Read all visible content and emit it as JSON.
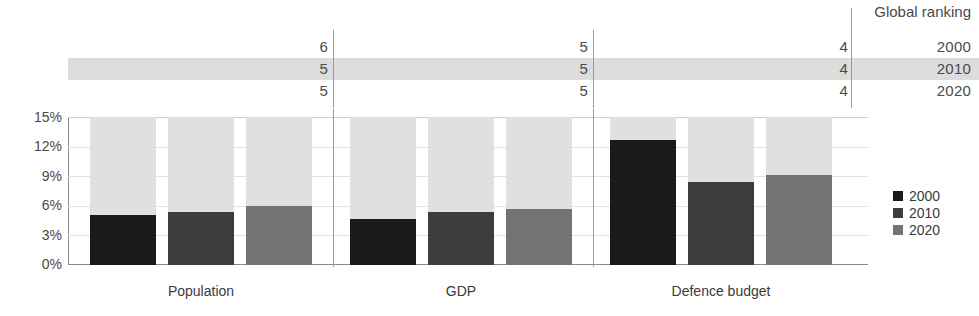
{
  "chart_data": {
    "type": "bar",
    "title": "",
    "subtitle": "",
    "xlabel": "",
    "ylabel": "",
    "ylim": [
      0,
      15
    ],
    "y_unit": "%",
    "grid": true,
    "legend_position": "right",
    "categories": [
      "Population",
      "GDP",
      "Defence budget"
    ],
    "series": [
      {
        "name": "2000",
        "color": "#1a1a1a",
        "values": [
          5.1,
          4.7,
          12.7
        ]
      },
      {
        "name": "2010",
        "color": "#3d3d3d",
        "values": [
          5.4,
          5.4,
          8.4
        ]
      },
      {
        "name": "2020",
        "color": "#737373",
        "values": [
          6.0,
          5.7,
          9.1
        ]
      }
    ],
    "remainder_color": "#e0e0e0",
    "y_ticks": [
      "0%",
      "3%",
      "6%",
      "9%",
      "12%",
      "15%"
    ],
    "y_tick_values": [
      0,
      3,
      6,
      9,
      12,
      15
    ],
    "annotation_table": {
      "header": "Global ranking",
      "row_labels": [
        "2000",
        "2010",
        "2020"
      ],
      "columns": [
        "Population",
        "GDP",
        "Defence budget"
      ],
      "rows": [
        {
          "year": "2000",
          "population": "6",
          "gdp": "5",
          "defence_budget": "4"
        },
        {
          "year": "2010",
          "population": "5",
          "gdp": "5",
          "defence_budget": "4"
        },
        {
          "year": "2020",
          "population": "5",
          "gdp": "5",
          "defence_budget": "4"
        }
      ],
      "highlighted_row": "2010"
    }
  },
  "legend": {
    "items": [
      {
        "label": "2000",
        "color": "#1a1a1a"
      },
      {
        "label": "2010",
        "color": "#3d3d3d"
      },
      {
        "label": "2020",
        "color": "#737373"
      }
    ]
  },
  "colors": {
    "series_2000": "#1a1a1a",
    "series_2010": "#3d3d3d",
    "series_2020": "#737373",
    "remainder": "#e0e0e0",
    "highlight_band": "#dcdcdc",
    "gridline": "#e2e2e2",
    "axis": "#8a8a8a",
    "text": "#3a3a3a",
    "background": "#ffffff"
  }
}
